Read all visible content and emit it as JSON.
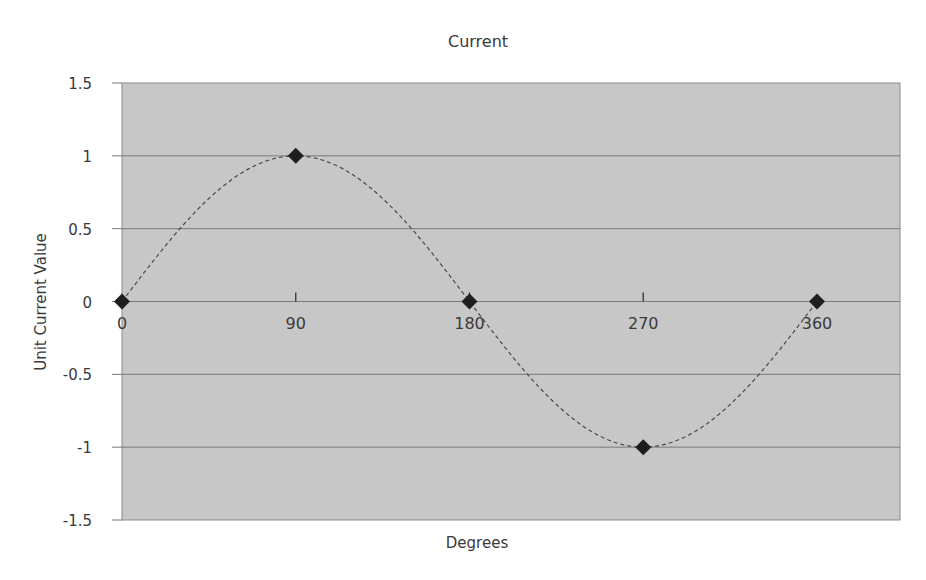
{
  "chart_data": {
    "type": "scatter",
    "title": "Current",
    "xlabel": "Degrees",
    "ylabel": "Unit Current Value",
    "x": [
      0,
      90,
      180,
      270,
      360
    ],
    "series": [
      {
        "name": "Current",
        "values": [
          0,
          1,
          0,
          -1,
          0
        ],
        "marker": "diamond",
        "line": "dashed smooth sine"
      }
    ],
    "xticks": [
      "0",
      "90",
      "180",
      "270",
      "360"
    ],
    "yticks": [
      "1.5",
      "1",
      "0.5",
      "0",
      "-0.5",
      "-1",
      "-1.5"
    ],
    "ylim": [
      -1.5,
      1.5
    ],
    "xlim": [
      0,
      360
    ],
    "grid": "horizontal",
    "legend": "none",
    "colors": {
      "plot_background": "#c7c7c7",
      "gridline": "#7a7a7a",
      "curve": "#4a4a4a",
      "marker": "#1e1e1e"
    }
  }
}
